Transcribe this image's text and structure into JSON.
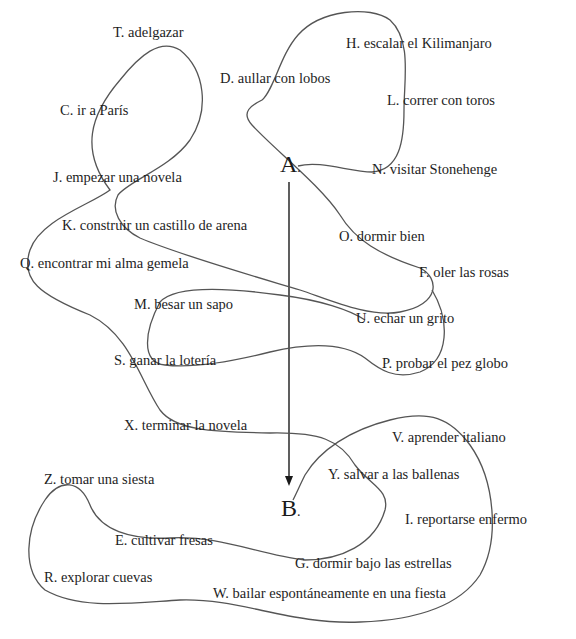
{
  "diagram": {
    "type": "path-through-items",
    "start": {
      "label": "A",
      "suffix": "."
    },
    "end": {
      "label": "B",
      "suffix": "."
    },
    "items": [
      {
        "id": "T",
        "text": "T. adelgazar"
      },
      {
        "id": "H",
        "text": "H. escalar el Kilimanjaro"
      },
      {
        "id": "D",
        "text": "D. aullar con lobos"
      },
      {
        "id": "C",
        "text": "C. ir a París"
      },
      {
        "id": "L",
        "text": "L. correr con toros"
      },
      {
        "id": "J",
        "text": "J. empezar una novela"
      },
      {
        "id": "N",
        "text": "N. visitar Stonehenge"
      },
      {
        "id": "K",
        "text": "K. construir un castillo de arena"
      },
      {
        "id": "O",
        "text": "O. dormir bien"
      },
      {
        "id": "Q",
        "text": "Q. encontrar mi alma gemela"
      },
      {
        "id": "F",
        "text": "F. oler las rosas"
      },
      {
        "id": "M",
        "text": "M. besar un sapo"
      },
      {
        "id": "U",
        "text": "U. echar un grito"
      },
      {
        "id": "S",
        "text": "S. ganar la lotería"
      },
      {
        "id": "P",
        "text": "P. probar el pez globo"
      },
      {
        "id": "X",
        "text": "X. terminar la novela"
      },
      {
        "id": "V",
        "text": "V. aprender italiano"
      },
      {
        "id": "Z",
        "text": "Z. tomar una siesta"
      },
      {
        "id": "Y",
        "text": "Y. salvar a las ballenas"
      },
      {
        "id": "I",
        "text": "I. reportarse enfermo"
      },
      {
        "id": "E",
        "text": "E. cultivar fresas"
      },
      {
        "id": "G",
        "text": "G. dormir bajo las estrellas"
      },
      {
        "id": "R",
        "text": "R. explorar cuevas"
      },
      {
        "id": "W",
        "text": "W. bailar espontáneamente en una fiesta"
      }
    ],
    "colors": {
      "background": "#ffffff",
      "text": "#1e1e1e",
      "curve": "#555555",
      "arrow": "#1a1a1a"
    }
  }
}
